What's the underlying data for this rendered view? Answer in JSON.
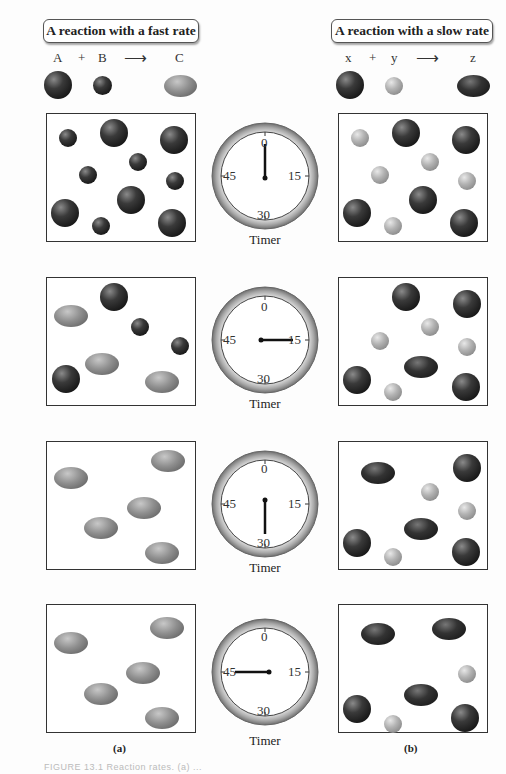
{
  "panel_a": {
    "title": "A reaction with a fast rate",
    "equation": {
      "reactant1": "A",
      "plus": "+",
      "reactant2": "B",
      "arrow": "⟶",
      "product": "C"
    },
    "label": "(a)"
  },
  "panel_b": {
    "title": "A reaction with a slow rate",
    "equation": {
      "reactant1": "x",
      "plus": "+",
      "reactant2": "y",
      "arrow": "⟶",
      "product": "z"
    },
    "label": "(b)"
  },
  "timer": {
    "label": "Timer",
    "ticks": {
      "top": "0",
      "right": "15",
      "bottom": "30",
      "left": "45"
    },
    "readings_seconds": [
      0,
      15,
      30,
      45
    ]
  },
  "caption": "FIGURE 13.1  Reaction rates. (a) ...",
  "colors": {
    "dark_molecule": "#222222",
    "light_molecule": "#b0b0b0",
    "product_fast": "#8f8f8f",
    "product_slow": "#333333",
    "border": "#333333"
  }
}
